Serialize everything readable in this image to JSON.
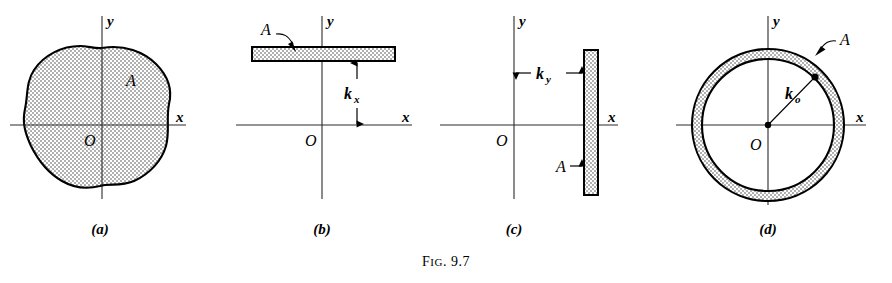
{
  "figure": {
    "caption_prefix": "F",
    "caption_rest": "IG",
    "caption_number": ". 9.7",
    "caption_full": "FIG. 9.7"
  },
  "panels": [
    {
      "id": "a",
      "label": "(a)",
      "description": "irregular plane area with centroidal axes",
      "shape": "irregular-blob",
      "labels": {
        "x_axis": "x",
        "y_axis": "y",
        "origin": "O",
        "area": "A"
      }
    },
    {
      "id": "b",
      "label": "(b)",
      "description": "horizontal strip at radius of gyration k sub x above x axis",
      "shape": "horizontal-strip",
      "labels": {
        "x_axis": "x",
        "y_axis": "y",
        "origin": "O",
        "area": "A",
        "dimension": "k",
        "dimension_sub": "x"
      }
    },
    {
      "id": "c",
      "label": "(c)",
      "description": "vertical strip at radius of gyration k sub y right of y axis",
      "shape": "vertical-strip",
      "labels": {
        "x_axis": "x",
        "y_axis": "y",
        "origin": "O",
        "area": "A",
        "dimension": "k",
        "dimension_sub": "y"
      }
    },
    {
      "id": "d",
      "label": "(d)",
      "description": "thin annular ring at polar radius of gyration k sub o",
      "shape": "annular-ring",
      "labels": {
        "x_axis": "x",
        "y_axis": "y",
        "origin": "O",
        "area": "A",
        "dimension": "k",
        "dimension_sub": "o"
      }
    }
  ],
  "colors": {
    "ink": "#000000",
    "axis": "#2b2b2b",
    "paper": "#ffffff",
    "stipple": "#3a3a3a"
  }
}
